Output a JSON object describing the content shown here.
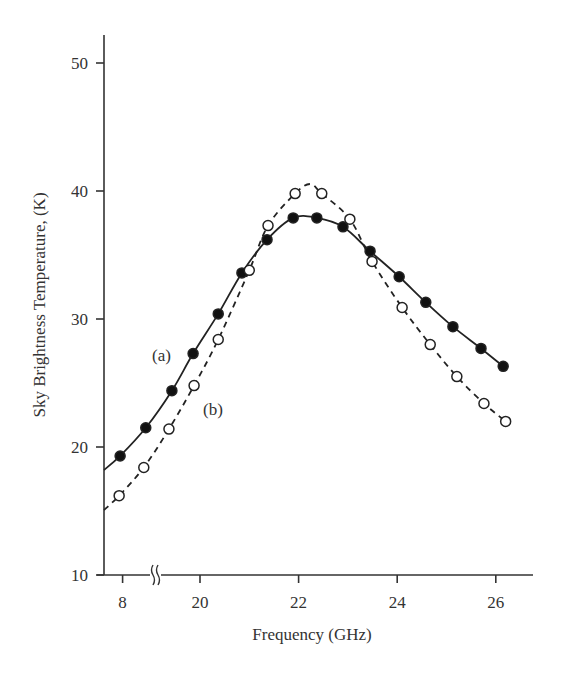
{
  "chart_data": {
    "type": "line",
    "title": "",
    "xlabel": "Frequency (GHz)",
    "ylabel": "Sky Brightness Temperature, (K)",
    "xlim": [
      17.9,
      26.7
    ],
    "ylim": [
      10,
      52
    ],
    "x_axis_break": {
      "after_tick": "8",
      "symbol": "double-wave"
    },
    "x_ticks": [
      {
        "label": "8",
        "pos": 18.43
      },
      {
        "label": "20",
        "pos": 20
      },
      {
        "label": "22",
        "pos": 22
      },
      {
        "label": "24",
        "pos": 24
      },
      {
        "label": "26",
        "pos": 26
      }
    ],
    "y_ticks": [
      10,
      20,
      30,
      40,
      50
    ],
    "grid": false,
    "legend": "inline labels",
    "series": [
      {
        "name": "(a)",
        "line_style": "solid",
        "marker": "filled-circle",
        "x": [
          18.38,
          18.9,
          19.43,
          19.86,
          20.37,
          20.85,
          21.36,
          21.89,
          22.37,
          22.9,
          23.45,
          24.04,
          24.58,
          25.13,
          25.7,
          26.15
        ],
        "values": [
          19.3,
          21.5,
          24.4,
          27.3,
          30.4,
          33.6,
          36.2,
          37.9,
          37.9,
          37.2,
          35.3,
          33.3,
          31.3,
          29.4,
          27.7,
          26.3
        ]
      },
      {
        "name": "(b)",
        "line_style": "dashed",
        "marker": "open-circle",
        "x": [
          18.36,
          18.86,
          19.37,
          19.88,
          20.37,
          21.0,
          21.38,
          21.93,
          22.47,
          23.04,
          23.49,
          24.1,
          24.67,
          25.21,
          25.76,
          26.2
        ],
        "values": [
          16.2,
          18.4,
          21.4,
          24.8,
          28.4,
          33.8,
          37.3,
          39.8,
          39.8,
          37.8,
          34.5,
          30.9,
          28.0,
          25.5,
          23.4,
          22.0
        ]
      }
    ],
    "annotations": [
      {
        "text": "(a)",
        "series": "(a)"
      },
      {
        "text": "(b)",
        "series": "(b)"
      }
    ]
  }
}
